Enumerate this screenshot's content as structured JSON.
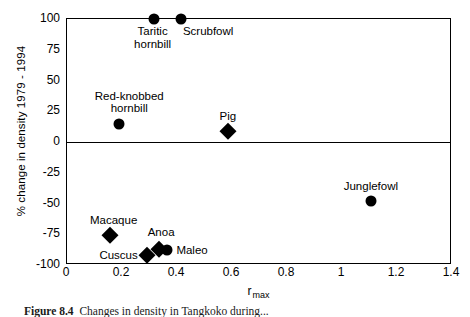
{
  "chart_data": {
    "type": "scatter",
    "title": "",
    "xlabel": "r max",
    "xlabel_base": "r",
    "xlabel_sub": "max",
    "ylabel": "% change in density 1979 - 1994",
    "xlim": [
      0,
      1.4
    ],
    "ylim": [
      -100,
      100
    ],
    "xticks": [
      "0",
      "0.2",
      "0.4",
      "0.6",
      "0.8",
      "1",
      "1.2",
      "1.4"
    ],
    "xtick_values": [
      0,
      0.2,
      0.4,
      0.6,
      0.8,
      1,
      1.2,
      1.4
    ],
    "yticks": [
      "100",
      "75",
      "50",
      "25",
      "0",
      "-25",
      "-50",
      "-75",
      "-100"
    ],
    "ytick_values": [
      100,
      75,
      50,
      25,
      0,
      -25,
      -50,
      -75,
      -100
    ],
    "grid": false,
    "legend": "none",
    "zero_reference_line": 0,
    "points": [
      {
        "label": "Taritic hornbill",
        "label_line1": "Taritic",
        "label_line2": "hornbill",
        "x": 0.315,
        "y": 100,
        "marker": "circle"
      },
      {
        "label": "Scrubfowl",
        "label_line1": "Scrubfowl",
        "label_line2": "",
        "x": 0.415,
        "y": 100,
        "marker": "circle"
      },
      {
        "label": "Red-knobbed hornbill",
        "label_line1": "Red-knobbed",
        "label_line2": "hornbill",
        "x": 0.19,
        "y": 15,
        "marker": "circle"
      },
      {
        "label": "Pig",
        "label_line1": "Pig",
        "label_line2": "",
        "x": 0.585,
        "y": 9,
        "marker": "diamond"
      },
      {
        "label": "Junglefowl",
        "label_line1": "Junglefowl",
        "label_line2": "",
        "x": 1.105,
        "y": -48,
        "marker": "circle"
      },
      {
        "label": "Macaque",
        "label_line1": "Macaque",
        "label_line2": "",
        "x": 0.155,
        "y": -76,
        "marker": "diamond"
      },
      {
        "label": "Cuscus",
        "label_line1": "Cuscus",
        "label_line2": "",
        "x": 0.29,
        "y": -92,
        "marker": "diamond"
      },
      {
        "label": "Anoa",
        "label_line1": "Anoa",
        "label_line2": "",
        "x": 0.335,
        "y": -87,
        "marker": "diamond"
      },
      {
        "label": "Maleo",
        "label_line1": "Maleo",
        "label_line2": "",
        "x": 0.365,
        "y": -88,
        "marker": "circle"
      }
    ]
  },
  "caption": {
    "figure_number": "Figure 8.4",
    "text": "Changes in density in Tangkoko during..."
  },
  "colors": {
    "marker": "#000000",
    "axis": "#000000",
    "background": "#ffffff"
  }
}
